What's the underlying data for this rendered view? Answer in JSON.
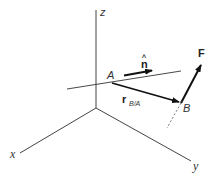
{
  "diagram": {
    "type": "3d-vector-moment-about-axis",
    "axes": {
      "x_label": "x",
      "y_label": "y",
      "z_label": "z"
    },
    "points": {
      "A_label": "A",
      "B_label": "B"
    },
    "vectors": {
      "unit_normal_label": "n",
      "unit_normal_hat": "^",
      "position_label_main": "r",
      "position_label_sub": "B/A",
      "force_label": "F"
    },
    "colors": {
      "axis_line": "#444444",
      "vector": "#111111",
      "text": "#333333",
      "background": "#ffffff"
    }
  }
}
